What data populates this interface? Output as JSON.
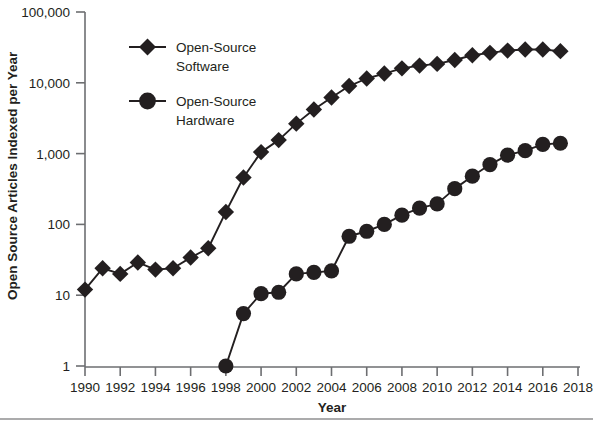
{
  "chart_data": {
    "type": "line",
    "title": "",
    "xlabel": "Year",
    "ylabel": "Open Source Articles Indexed per Year",
    "yscale": "log",
    "ylim": [
      1,
      100000
    ],
    "xlim": [
      1990,
      2018
    ],
    "grid": false,
    "legend_position": "upper-left-inside",
    "y_tick_labels": [
      "100,000",
      "10,000",
      "1,000",
      "100",
      "10",
      "1"
    ],
    "y_tick_values": [
      100000,
      10000,
      1000,
      100,
      10,
      1
    ],
    "x_tick_labels": [
      "1990",
      "1992",
      "1994",
      "1996",
      "1998",
      "2000",
      "2002",
      "2004",
      "2006",
      "2008",
      "2010",
      "2012",
      "2014",
      "2016",
      "2018"
    ],
    "x_tick_values": [
      1990,
      1992,
      1994,
      1996,
      1998,
      2000,
      2002,
      2004,
      2006,
      2008,
      2010,
      2012,
      2014,
      2016,
      2018
    ],
    "x": [
      1990,
      1991,
      1992,
      1993,
      1994,
      1995,
      1996,
      1997,
      1998,
      1999,
      2000,
      2001,
      2002,
      2003,
      2004,
      2005,
      2006,
      2007,
      2008,
      2009,
      2010,
      2011,
      2012,
      2013,
      2014,
      2015,
      2016,
      2017
    ],
    "series": [
      {
        "name": "Open-Source Software",
        "marker": "diamond",
        "color": "#231f20",
        "x": [
          1990,
          1991,
          1992,
          1993,
          1994,
          1995,
          1996,
          1997,
          1998,
          1999,
          2000,
          2001,
          2002,
          2003,
          2004,
          2005,
          2006,
          2007,
          2008,
          2009,
          2010,
          2011,
          2012,
          2013,
          2014,
          2015,
          2016,
          2017
        ],
        "values": [
          12,
          24,
          20,
          29,
          23,
          24,
          34,
          46,
          150,
          460,
          1050,
          1550,
          2650,
          4200,
          6200,
          9000,
          11500,
          13500,
          16000,
          17500,
          18500,
          21000,
          24500,
          26500,
          28500,
          29500,
          29500,
          28000
        ]
      },
      {
        "name": "Open-Source Hardware",
        "marker": "circle",
        "color": "#231f20",
        "x": [
          1998,
          1999,
          2000,
          2001,
          2002,
          2003,
          2004,
          2005,
          2006,
          2007,
          2008,
          2009,
          2010,
          2011,
          2012,
          2013,
          2014,
          2015,
          2016,
          2017
        ],
        "values": [
          1,
          5.5,
          10.5,
          11,
          20,
          21,
          22,
          68,
          80,
          100,
          135,
          170,
          195,
          320,
          480,
          700,
          950,
          1100,
          1350,
          1400
        ]
      }
    ]
  },
  "legend": {
    "items": [
      {
        "label_line1": "Open-Source",
        "label_line2": "Software",
        "marker": "diamond"
      },
      {
        "label_line1": "Open-Source",
        "label_line2": "Hardware",
        "marker": "circle"
      }
    ]
  },
  "axes": {
    "y_title": "Open Source Articles Indexed per Year",
    "x_title": "Year"
  }
}
